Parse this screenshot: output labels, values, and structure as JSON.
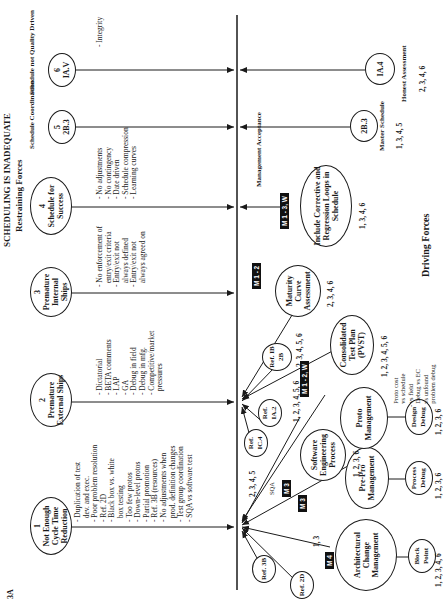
{
  "page_number": "3A",
  "title": "SCHEDULING IS INADEQUATE",
  "subtitle": "Restraining Forces",
  "driving_label": "Driving Forces",
  "restraining": [
    {
      "num": "1",
      "label": "Not Enough Cycle Time Reduction",
      "bullets": [
        "Duplication of test",
        "dev. and exec.",
        "Poor problem resolution",
        "Ref. 2D",
        "Black box vs. white",
        "box testing",
        "Too few protos",
        "Down-level protos",
        "Partial promotion",
        "Ref. 3B (resources)",
        "No adjustments when",
        "prod. definition changes",
        "Test group coordination",
        "SQA vs software test"
      ]
    },
    {
      "num": "2",
      "label": "Premature External Ships",
      "bullets": [
        "Dictatorial",
        "BETA comments",
        "LAP",
        "GA",
        "Debug in field",
        "Debug in mfg.",
        "Competitive/market",
        "pressures"
      ]
    },
    {
      "num": "3",
      "label": "Premature Internal Ships",
      "bullets": [
        "No enforcement of",
        "entry/exit criteria",
        "Entry/exit not",
        "always defined",
        "Entry/exit not",
        "always agreed on"
      ]
    },
    {
      "num": "4",
      "label": "Schedule for Success",
      "bullets": [
        "No adjustments",
        "No contingency",
        "Date driven",
        "Schedule compression",
        "Learning curves"
      ]
    },
    {
      "num": "5",
      "label": "2B.3",
      "caption": "Schedule Coordination"
    },
    {
      "num": "6",
      "label": "IA.V",
      "caption": "Schedule not Quality Driven",
      "bullets": [
        "Integrity"
      ]
    }
  ],
  "driving": {
    "refs": [
      {
        "label": "Ref. 3B"
      },
      {
        "label": "Ref. 2D"
      },
      {
        "label": "Ref. IC.4"
      },
      {
        "label": "Ref. IA.2",
        "nums": "1, 2, 3, 4, 5, 6"
      },
      {
        "label": "Ref. IB 2B",
        "nums": "2, 3, 4, 5, 6"
      }
    ],
    "ref_ic4_nums": "2, 3, 4, 5",
    "sqa_note": "SQA",
    "nodes": [
      {
        "label": "Architectural Change Management",
        "badge": "M 4",
        "nums": "1, 3",
        "child": "Block Point",
        "child_nums": "1, 2, 3, 4, 6"
      },
      {
        "label": "Pre-Pro Management",
        "badge": "M 3",
        "child": "Process Debug",
        "child_nums": "1, 2, 3, 6"
      },
      {
        "label": "Software Engineering Process",
        "badge": "M 3",
        "nums": "1, 2, 3, 6"
      },
      {
        "label": "Proto Management",
        "child": "Design Debug",
        "child_nums": "1, 2, 3, 6"
      },
      {
        "label": "Consolidated Test Plan (PVST)",
        "badge": "M 1 - 2, W",
        "nums": "1, 2, 3, 4, 5, 6"
      },
      {
        "label": "Maturity Curve Assessment",
        "badge": "M 1 - 2",
        "nums": "2, 3, 4, 6"
      },
      {
        "label": "Include Corrective and Regression Loops in Schedule",
        "badge": "M 1 - 3, W",
        "nums": "1, 3, 4, 6",
        "note": "Management Acceptance"
      },
      {
        "label": "2B.3",
        "caption": "Master Schedule",
        "nums": "1, 3, 4, 5"
      },
      {
        "label": "IA.4",
        "caption": "Honest Assessment",
        "nums": "2, 3, 4, 6"
      }
    ],
    "proto_notes": [
      "Proto cost",
      "vs schedule",
      "vs field",
      "Debug vs EC",
      "vs unfound",
      "problem debug"
    ]
  }
}
